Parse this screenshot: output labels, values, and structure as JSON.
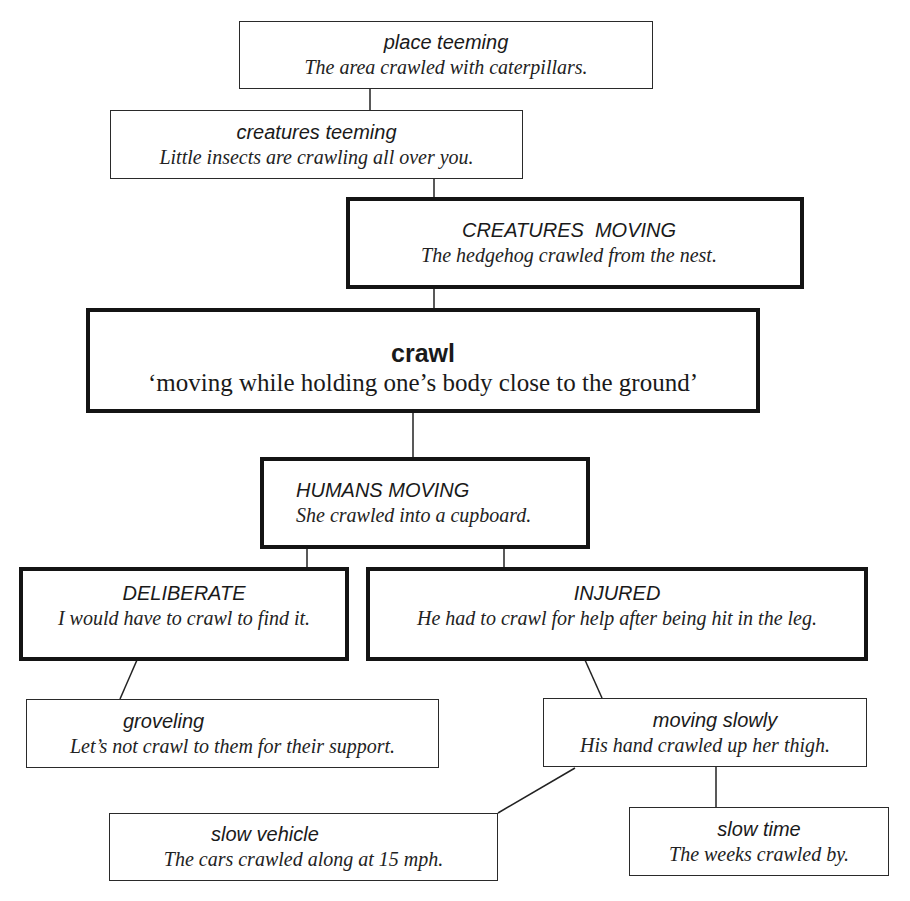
{
  "diagram": {
    "root": {
      "word": "crawl",
      "gloss": "‘moving while holding one’s body close to the ground’"
    },
    "nodes": {
      "place_teeming": {
        "label": "place teeming",
        "example": "The area crawled with caterpillars."
      },
      "creatures_teeming": {
        "label": "creatures teeming",
        "example": "Little insects are crawling all over you."
      },
      "creatures_moving": {
        "label": "CREATURES  MOVING",
        "example": "The hedgehog crawled from the nest."
      },
      "humans_moving": {
        "label": "HUMANS MOVING",
        "example": "She crawled into a cupboard."
      },
      "deliberate": {
        "label": "DELIBERATE",
        "example": "I would have to crawl to find it."
      },
      "injured": {
        "label": "INJURED",
        "example": "He had to crawl for help after being hit in the leg."
      },
      "groveling": {
        "label": "groveling",
        "example": "Let’s not crawl to them for their support."
      },
      "moving_slowly": {
        "label": "moving slowly",
        "example": "His hand crawled up her thigh."
      },
      "slow_vehicle": {
        "label": "slow vehicle",
        "example": "The cars crawled along at 15 mph."
      },
      "slow_time": {
        "label": "slow time",
        "example": "The weeks crawled by."
      }
    },
    "edges": [
      [
        "place_teeming",
        "creatures_teeming"
      ],
      [
        "creatures_teeming",
        "creatures_moving"
      ],
      [
        "creatures_moving",
        "crawl"
      ],
      [
        "crawl",
        "humans_moving"
      ],
      [
        "humans_moving",
        "deliberate"
      ],
      [
        "humans_moving",
        "injured"
      ],
      [
        "deliberate",
        "groveling"
      ],
      [
        "injured",
        "moving_slowly"
      ],
      [
        "moving_slowly",
        "slow_vehicle"
      ],
      [
        "moving_slowly",
        "slow_time"
      ]
    ],
    "colors": {
      "line": "#222222",
      "background": "#ffffff",
      "text": "#1a1a1a"
    }
  }
}
